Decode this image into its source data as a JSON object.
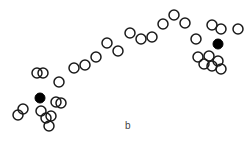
{
  "chart_data": {
    "type": "scatter",
    "title": "",
    "xlabel": "",
    "ylabel": "",
    "grid": false,
    "axes_visible": false,
    "legend": null,
    "panel_label": "b",
    "marker_radius": 5,
    "series": [
      {
        "name": "samples",
        "marker": "open-circle",
        "color": "#1a1a1a",
        "points": [
          [
            37,
            73
          ],
          [
            43,
            73
          ],
          [
            59,
            82
          ],
          [
            74,
            68
          ],
          [
            85,
            65
          ],
          [
            96,
            57
          ],
          [
            107,
            43
          ],
          [
            118,
            51
          ],
          [
            130,
            33
          ],
          [
            141,
            39
          ],
          [
            152,
            37
          ],
          [
            163,
            24
          ],
          [
            174,
            15
          ],
          [
            185,
            23
          ],
          [
            212,
            25
          ],
          [
            221,
            29
          ],
          [
            238,
            29
          ],
          [
            196,
            39
          ],
          [
            56,
            102
          ],
          [
            61,
            103
          ],
          [
            23,
            109
          ],
          [
            18,
            115
          ],
          [
            41,
            111
          ],
          [
            46,
            118
          ],
          [
            51,
            116
          ],
          [
            49,
            126
          ],
          [
            198,
            57
          ],
          [
            209,
            56
          ],
          [
            218,
            61
          ],
          [
            204,
            64
          ],
          [
            212,
            66
          ],
          [
            221,
            69
          ]
        ]
      },
      {
        "name": "centroids",
        "marker": "filled-circle",
        "color": "#000000",
        "points": [
          [
            40,
            98
          ],
          [
            218,
            44
          ]
        ]
      }
    ]
  },
  "labels": {
    "panel": "b"
  }
}
